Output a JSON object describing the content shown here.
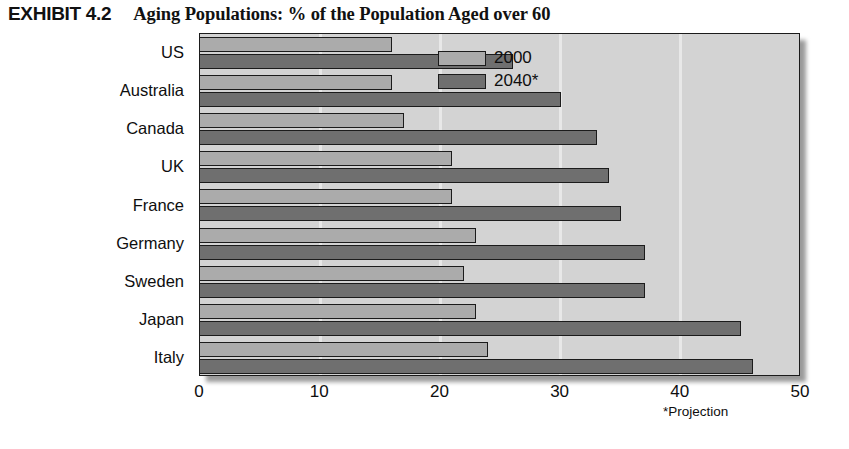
{
  "exhibit": {
    "label": "EXHIBIT 4.2",
    "title": "Aging Populations: % of the Population Aged over 60"
  },
  "chart_data": {
    "type": "bar",
    "orientation": "horizontal",
    "title": "Aging Populations: % of the Population Aged over 60",
    "xlabel": "",
    "ylabel": "",
    "xlim": [
      0,
      50
    ],
    "xticks": [
      0,
      10,
      20,
      30,
      40,
      50
    ],
    "grid": true,
    "grid_axis": "x",
    "legend_position": "upper right inside",
    "categories": [
      "US",
      "Australia",
      "Canada",
      "UK",
      "France",
      "Germany",
      "Sweden",
      "Japan",
      "Italy"
    ],
    "series": [
      {
        "name": "2000",
        "color": "#ababab",
        "values": [
          16,
          16,
          17,
          21,
          21,
          23,
          22,
          23,
          24
        ]
      },
      {
        "name": "2040*",
        "color": "#6f6f6f",
        "values": [
          26,
          30,
          33,
          34,
          35,
          37,
          37,
          45,
          46
        ]
      }
    ],
    "annotations": [
      {
        "name": "projection-note",
        "text": "*Projection"
      }
    ]
  },
  "legend": {
    "items": [
      {
        "label": "2000",
        "swatch": "light-gray-swatch"
      },
      {
        "label": "2040*",
        "swatch": "dark-gray-swatch"
      }
    ]
  },
  "axis": {
    "x_tick_labels": [
      "0",
      "10",
      "20",
      "30",
      "40",
      "50"
    ],
    "y_tick_labels": [
      "US",
      "Australia",
      "Canada",
      "UK",
      "France",
      "Germany",
      "Sweden",
      "Japan",
      "Italy"
    ]
  },
  "notes": {
    "projection": "*Projection"
  },
  "colors": {
    "series_2000": "#ababab",
    "series_2040": "#6f6f6f",
    "plot_background": "#d3d3d3",
    "outline": "#1b1b1b",
    "page_background": "#ffffff"
  }
}
